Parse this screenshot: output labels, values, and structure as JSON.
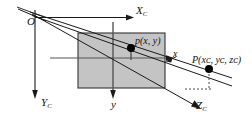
{
  "figure": {
    "background_color": "#ffffff",
    "line_color": "#1a1a1a",
    "plane_fill_color": "#c4c4c4",
    "plane_stroke_color": "#333333",
    "point_color": "#000000",
    "labels": {
      "origin": "O",
      "axis_x_camera": "X",
      "axis_x_camera_sub": "C",
      "axis_y_camera": "Y",
      "axis_y_camera_sub": "C",
      "axis_z_camera": "Z",
      "axis_z_camera_sub": "C",
      "image_axis_x": "x",
      "image_axis_y": "y",
      "image_point": "p(x, y)",
      "world_point_name": "P",
      "world_point_coords": "(xᴄ, yᴄ, zᴄ)"
    },
    "image_plane": {
      "left": 78,
      "top": 33,
      "right": 165,
      "bottom": 88
    },
    "points": {
      "p": {
        "x": 131,
        "y": 48,
        "label": "p(x, y)"
      },
      "P": {
        "x": 209,
        "y": 69,
        "label": "P(xC, yC, zC)"
      }
    }
  }
}
